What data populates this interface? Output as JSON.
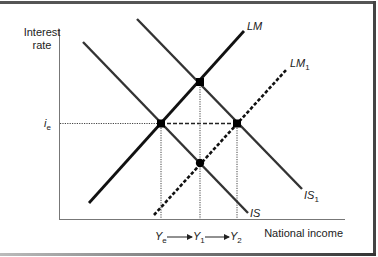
{
  "diagram": {
    "y_axis_label_line1": "Interest",
    "y_axis_label_line2": "rate",
    "x_axis_label": "National income",
    "i_label_main": "i",
    "i_label_sub": "e",
    "curves": {
      "LM": {
        "label": "LM",
        "sub": "",
        "style": "solid"
      },
      "LM1": {
        "label": "LM",
        "sub": "1",
        "style": "dashed"
      },
      "IS": {
        "label": "IS",
        "sub": "",
        "style": "solid"
      },
      "IS1": {
        "label": "IS",
        "sub": "1",
        "style": "solid"
      }
    },
    "x_markers": [
      {
        "main": "Y",
        "sub": "e"
      },
      {
        "main": "Y",
        "sub": "1"
      },
      {
        "main": "Y",
        "sub": "2"
      }
    ],
    "equilibria": [
      {
        "name": "IS∩LM",
        "at": "(Ye, ie)"
      },
      {
        "name": "IS1∩LM",
        "at": "(Y1, above ie)"
      },
      {
        "name": "IS∩LM1",
        "at": "(Y1, below ie)"
      },
      {
        "name": "IS1∩LM1",
        "at": "(Y2, ie)"
      }
    ],
    "colors": {
      "line": "#1a1a1a",
      "is_line": "#333333",
      "axis": "#666666",
      "frame": "#444444"
    }
  }
}
